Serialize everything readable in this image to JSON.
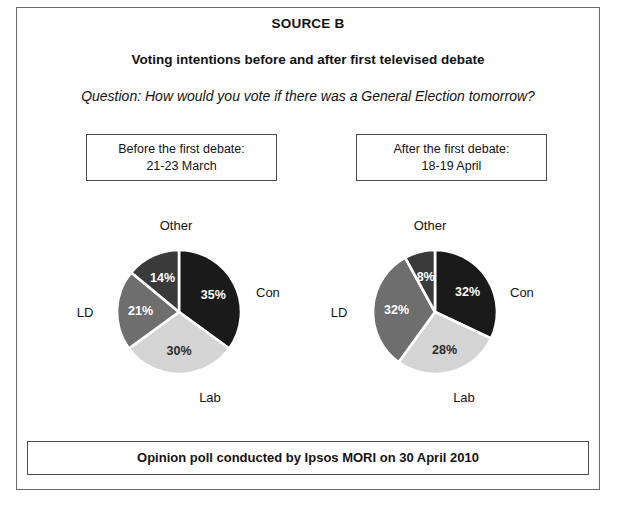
{
  "document": {
    "source_title": "SOURCE B",
    "sub_title": "Voting intentions before and after first televised debate",
    "question_label": "Question:",
    "question_text": " How would you vote if there was a General Election tomorrow?",
    "footer": "Opinion poll conducted by Ipsos MORI on 30 April 2010"
  },
  "captions": {
    "before": {
      "line1": "Before the first debate:",
      "line2": "21-23 March"
    },
    "after": {
      "line1": "After the first debate:",
      "line2": "18-19 April"
    }
  },
  "colors": {
    "con": "#1a1a1a",
    "lab": "#d4d4d4",
    "ld": "#6e6e6e",
    "other": "#3a3a3a",
    "separator": "#ffffff",
    "frame": "#6b6b6b",
    "box_border": "#4a4a4a",
    "text": "#131313",
    "value_light": "#ffffff",
    "value_dark": "#2b2b2b"
  },
  "chart_data": [
    {
      "type": "pie",
      "title": "Before the first debate: 21-23 March",
      "categories": [
        "Con",
        "Lab",
        "LD",
        "Other"
      ],
      "values": [
        35,
        30,
        21,
        14
      ],
      "value_labels": [
        "35%",
        "30%",
        "21%",
        "14%"
      ],
      "colors": [
        "#1a1a1a",
        "#d4d4d4",
        "#6e6e6e",
        "#3a3a3a"
      ],
      "legend": "outside-labels",
      "start_angle_deg": 0,
      "direction": "clockwise",
      "unit": "%"
    },
    {
      "type": "pie",
      "title": "After the first debate: 18-19 April",
      "categories": [
        "Con",
        "Lab",
        "LD",
        "Other"
      ],
      "values": [
        32,
        28,
        32,
        8
      ],
      "value_labels": [
        "32%",
        "28%",
        "32%",
        "8%"
      ],
      "colors": [
        "#1a1a1a",
        "#d4d4d4",
        "#6e6e6e",
        "#3a3a3a"
      ],
      "legend": "outside-labels",
      "start_angle_deg": 0,
      "direction": "clockwise",
      "unit": "%"
    }
  ],
  "labels": {
    "con": "Con",
    "lab": "Lab",
    "ld": "LD",
    "other": "Other"
  }
}
